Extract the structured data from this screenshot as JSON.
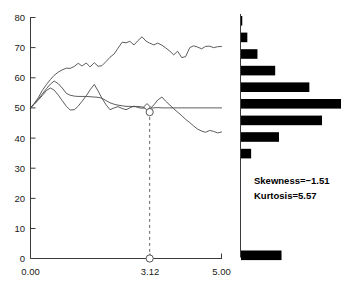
{
  "chart_data": {
    "type": "line",
    "title": "",
    "xlabel": "",
    "ylabel": "",
    "xlim": [
      0.0,
      5.0
    ],
    "ylim": [
      0,
      80
    ],
    "grid": false,
    "legend": null,
    "x_tick_labels": [
      "0.00",
      "3.12",
      "5.00"
    ],
    "x_tick_values": [
      0.0,
      3.12,
      5.0
    ],
    "y_tick_labels": [
      "0",
      "10",
      "20",
      "30",
      "40",
      "50",
      "60",
      "70",
      "80"
    ],
    "y_tick_values": [
      0,
      10,
      20,
      30,
      40,
      50,
      60,
      70,
      80
    ],
    "x": [
      0.0,
      0.1,
      0.21,
      0.31,
      0.42,
      0.52,
      0.62,
      0.73,
      0.83,
      0.94,
      1.04,
      1.15,
      1.25,
      1.35,
      1.46,
      1.56,
      1.67,
      1.77,
      1.87,
      1.98,
      2.08,
      2.19,
      2.29,
      2.4,
      2.5,
      2.6,
      2.71,
      2.81,
      2.92,
      3.02,
      3.12,
      3.23,
      3.33,
      3.44,
      3.54,
      3.65,
      3.75,
      3.85,
      3.96,
      4.06,
      4.17,
      4.27,
      4.37,
      4.48,
      4.58,
      4.69,
      4.79,
      4.9,
      5.0
    ],
    "series": [
      {
        "name": "upper-series",
        "values": [
          50.0,
          51.5,
          53.5,
          55.8,
          57.8,
          59.4,
          60.8,
          61.9,
          62.6,
          63.2,
          63.1,
          63.8,
          64.8,
          63.9,
          64.9,
          63.6,
          65.0,
          63.8,
          64.0,
          65.4,
          66.8,
          67.9,
          69.8,
          71.8,
          71.6,
          72.1,
          70.9,
          72.3,
          73.6,
          72.2,
          71.5,
          70.9,
          71.5,
          70.8,
          69.9,
          68.8,
          67.6,
          68.8,
          66.7,
          67.0,
          70.0,
          70.6,
          70.2,
          69.6,
          70.4,
          70.5,
          70.0,
          70.3,
          70.4
        ]
      },
      {
        "name": "middle-series",
        "values": [
          50.0,
          51.4,
          53.0,
          54.6,
          56.4,
          57.9,
          58.9,
          58.0,
          56.6,
          54.8,
          54.2,
          53.9,
          53.8,
          53.8,
          53.8,
          53.7,
          53.6,
          53.5,
          53.2,
          52.4,
          51.7,
          51.2,
          50.9,
          50.7,
          50.5,
          50.5,
          50.4,
          50.5,
          50.3,
          49.9,
          49.6,
          51.0,
          52.6,
          53.6,
          52.2,
          50.9,
          49.7,
          48.6,
          47.4,
          46.2,
          45.1,
          44.0,
          43.0,
          42.3,
          41.9,
          42.5,
          42.2,
          41.7,
          42.0
        ]
      },
      {
        "name": "lower-series",
        "values": [
          50.0,
          51.2,
          52.7,
          54.1,
          55.8,
          56.6,
          55.9,
          54.2,
          52.4,
          50.5,
          49.3,
          49.4,
          50.6,
          52.2,
          54.0,
          56.0,
          57.8,
          55.6,
          53.2,
          51.0,
          49.4,
          50.0,
          50.4,
          49.8,
          49.4,
          50.0,
          50.6,
          50.1,
          49.9,
          50.0,
          49.9,
          50.0,
          50.1,
          50.0,
          50.0,
          50.0,
          50.0,
          50.0,
          50.0,
          50.0,
          50.0,
          50.0,
          50.0,
          50.0,
          50.0,
          50.0,
          50.0,
          50.0,
          50.0
        ]
      }
    ],
    "markers": [
      {
        "name": "diamond-marker-on-line",
        "x": 3.05,
        "y": 50.3,
        "shape": "diamond"
      },
      {
        "name": "circle-marker-on-line",
        "x": 3.12,
        "y": 48.6,
        "shape": "circle"
      },
      {
        "name": "circle-marker-on-axis",
        "x": 3.12,
        "y": 0,
        "shape": "circle"
      }
    ],
    "reference_line": {
      "name": "dropline-at-3.12",
      "x": 3.12,
      "y_from": 47.0,
      "y_to": 0,
      "style": "dashed"
    }
  },
  "histogram": {
    "type": "bar",
    "orientation": "horizontal",
    "note": "marginal distribution of the final values, drawn to the right of the main axes",
    "bins": [
      {
        "label": "bin-1",
        "value": 1
      },
      {
        "label": "bin-2",
        "value": 5
      },
      {
        "label": "bin-3",
        "value": 13
      },
      {
        "label": "bin-4",
        "value": 27
      },
      {
        "label": "bin-5",
        "value": 54
      },
      {
        "label": "bin-6",
        "value": 79
      },
      {
        "label": "bin-7",
        "value": 64
      },
      {
        "label": "bin-8",
        "value": 30
      },
      {
        "label": "bin-9",
        "value": 8
      },
      {
        "label": "bin-10",
        "value": 32
      }
    ],
    "max_value": 79
  },
  "statistics": {
    "skewness_label": "Skewness=−1.51",
    "kurtosis_label": "Kurtosis=5.57",
    "skewness_value": -1.51,
    "kurtosis_value": 5.57
  },
  "colors": {
    "background": "#ffffff",
    "line": "#4a4a4a",
    "axis": "#3a3a3a",
    "bar": "#000000",
    "text": "#000000",
    "dropline": "#666666"
  }
}
